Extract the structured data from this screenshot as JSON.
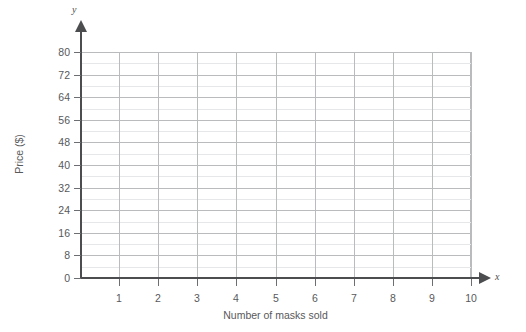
{
  "chart_data": {
    "type": "line",
    "title": "",
    "subtitle": "",
    "xlabel": "Number of masks sold",
    "ylabel": "Price ($)",
    "x_axis_name": "x",
    "y_axis_name": "y",
    "xlim": [
      0,
      10
    ],
    "ylim": [
      0,
      80
    ],
    "x_ticks": [
      0,
      1,
      2,
      3,
      4,
      5,
      6,
      7,
      8,
      9,
      10
    ],
    "x_ticklabels": [
      "",
      "1",
      "2",
      "3",
      "4",
      "5",
      "6",
      "7",
      "8",
      "9",
      "10"
    ],
    "y_ticks": [
      0,
      8,
      16,
      24,
      32,
      40,
      48,
      56,
      64,
      72,
      80
    ],
    "y_ticklabels": [
      "0",
      "8",
      "16",
      "24",
      "32",
      "40",
      "48",
      "56",
      "64",
      "72",
      "80"
    ],
    "y_minor_ticks": [
      4,
      12,
      20,
      28,
      36,
      44,
      52,
      60,
      68,
      76
    ],
    "x_major_step": 1,
    "y_major_step": 8,
    "y_minor_step": 4,
    "grid": true,
    "grid_major_color": "#b9bbbd",
    "grid_minor_color": "#e6e7e8",
    "axis_color": "#4c4d4f",
    "text_color": "#58595b",
    "background": "#ffffff",
    "legend": null,
    "legend_position": "none",
    "series": [],
    "annotations": [],
    "note": "Empty coordinate grid / blank graph paper with no plotted data"
  }
}
